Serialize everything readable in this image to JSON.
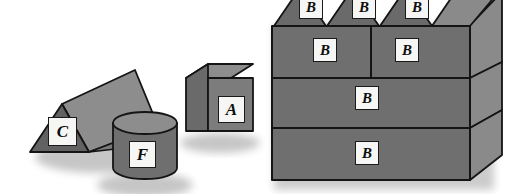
{
  "scene": {
    "title": "Geometric solids illustration",
    "background_color": "#ffffff",
    "palette": {
      "face_front": "#6f6f6f",
      "face_top": "#8d8d8d",
      "face_side": "#8a8a8a",
      "face_dark": "#626262",
      "outline": "#141414",
      "label_fill": "#f6f6f4",
      "label_text": "#0d0d0d",
      "shadow": "#9a9a9a"
    }
  },
  "solids": [
    {
      "id": "prism-c",
      "shape": "triangular-prism",
      "label": "C",
      "label_x": 48,
      "label_y": 117,
      "label_w": 29,
      "label_h": 29,
      "label_font_size": 17
    },
    {
      "id": "cylinder-f",
      "shape": "cylinder",
      "label": "F",
      "label_x": 129,
      "label_y": 141,
      "label_w": 27,
      "label_h": 27,
      "label_font_size": 17
    },
    {
      "id": "cube-a",
      "shape": "cube",
      "label": "A",
      "label_x": 218,
      "label_y": 96,
      "label_w": 27,
      "label_h": 27,
      "label_font_size": 17
    },
    {
      "id": "stack-prism-b1",
      "shape": "triangular-prism",
      "label": "B",
      "label_x": 299,
      "label_y": -5,
      "label_w": 24,
      "label_h": 24,
      "label_font_size": 15
    },
    {
      "id": "stack-prism-b2",
      "shape": "triangular-prism",
      "label": "B",
      "label_x": 352,
      "label_y": -5,
      "label_w": 24,
      "label_h": 24,
      "label_font_size": 15
    },
    {
      "id": "stack-prism-b3",
      "shape": "triangular-prism",
      "label": "B",
      "label_x": 405,
      "label_y": -5,
      "label_w": 24,
      "label_h": 24,
      "label_font_size": 15
    },
    {
      "id": "stack-block-b4",
      "shape": "rectangular-block",
      "label": "B",
      "label_x": 313,
      "label_y": 38,
      "label_w": 24,
      "label_h": 24,
      "label_font_size": 15
    },
    {
      "id": "stack-block-b5",
      "shape": "rectangular-block",
      "label": "B",
      "label_x": 395,
      "label_y": 38,
      "label_w": 24,
      "label_h": 24,
      "label_font_size": 15
    },
    {
      "id": "stack-block-b6",
      "shape": "rectangular-block",
      "label": "B",
      "label_x": 355,
      "label_y": 86,
      "label_w": 24,
      "label_h": 24,
      "label_font_size": 15
    },
    {
      "id": "stack-block-b7",
      "shape": "rectangular-block",
      "label": "B",
      "label_x": 355,
      "label_y": 141,
      "label_w": 24,
      "label_h": 24,
      "label_font_size": 15
    }
  ]
}
